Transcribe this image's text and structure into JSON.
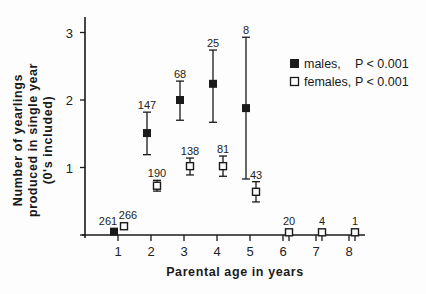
{
  "chart_data": {
    "type": "scatter",
    "title": "",
    "xlabel": "Parental age in years",
    "ylabel_lines": [
      "Number of yearlings",
      "produced in single year",
      "(0's included)"
    ],
    "ylabel": "Number of yearlings produced in single year (0's included)",
    "xlim": [
      0.3,
      8.5
    ],
    "ylim": [
      0,
      3.2
    ],
    "x_ticks": [
      1,
      2,
      3,
      4,
      5,
      6,
      7,
      8
    ],
    "y_ticks": [
      0,
      1,
      2,
      3
    ],
    "y_tick_labels": [
      "",
      "1",
      "2",
      "3"
    ],
    "grid": false,
    "legend_position": "upper right",
    "series": [
      {
        "name": "males",
        "legend_label": "males,",
        "p_value_label": "P < 0.001",
        "marker": "filled-square",
        "color": "#1a1a1a",
        "points": [
          {
            "x": 1,
            "y": 0.05,
            "err_low": null,
            "err_high": null,
            "n": "261"
          },
          {
            "x": 2,
            "y": 1.51,
            "err_low": 1.19,
            "err_high": 1.82,
            "n": "147"
          },
          {
            "x": 3,
            "y": 2.0,
            "err_low": 1.7,
            "err_high": 2.28,
            "n": "68"
          },
          {
            "x": 4,
            "y": 2.24,
            "err_low": 1.67,
            "err_high": 2.74,
            "n": "25"
          },
          {
            "x": 5,
            "y": 1.88,
            "err_low": 0.83,
            "err_high": 2.93,
            "n": "8"
          }
        ]
      },
      {
        "name": "females",
        "legend_label": "females,",
        "p_value_label": "P < 0.001",
        "marker": "open-square",
        "color": "#1a1a1a",
        "points": [
          {
            "x": 1,
            "y": 0.13,
            "err_low": null,
            "err_high": null,
            "n": "266"
          },
          {
            "x": 2,
            "y": 0.73,
            "err_low": 0.65,
            "err_high": 0.81,
            "n": "190"
          },
          {
            "x": 3,
            "y": 1.02,
            "err_low": 0.89,
            "err_high": 1.14,
            "n": "138"
          },
          {
            "x": 4,
            "y": 1.02,
            "err_low": 0.87,
            "err_high": 1.17,
            "n": "81"
          },
          {
            "x": 5,
            "y": 0.64,
            "err_low": 0.49,
            "err_high": 0.79,
            "n": "43"
          },
          {
            "x": 6,
            "y": 0.04,
            "err_low": null,
            "err_high": null,
            "n": "20"
          },
          {
            "x": 7,
            "y": 0.04,
            "err_low": null,
            "err_high": null,
            "n": "4"
          },
          {
            "x": 8,
            "y": 0.04,
            "err_low": null,
            "err_high": null,
            "n": "1"
          }
        ]
      }
    ]
  },
  "layout_px": {
    "axis_x0": 85,
    "axis_y0": 235,
    "axis_top": 17,
    "axis_right": 365,
    "x_origin_val": 0,
    "px_per_year": 33,
    "x_offset": 85,
    "px_per_unit_y": 67.5,
    "male_dx": -4,
    "female_dx": 6
  }
}
